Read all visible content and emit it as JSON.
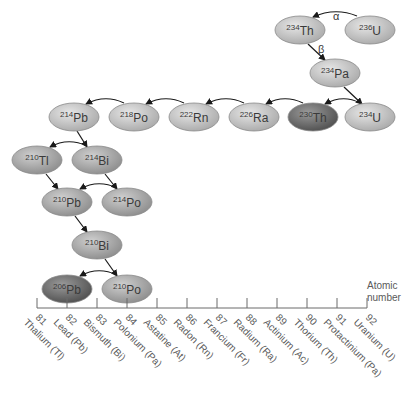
{
  "diagram": {
    "nuclides": [
      {
        "id": "th234",
        "mass": "234",
        "symbol": "Th",
        "cx": 300,
        "cy": 30,
        "shade": "light"
      },
      {
        "id": "u236",
        "mass": "236",
        "symbol": "U",
        "cx": 370,
        "cy": 30,
        "shade": "light"
      },
      {
        "id": "pa234",
        "mass": "234",
        "symbol": "Pa",
        "cx": 335,
        "cy": 73,
        "shade": "light"
      },
      {
        "id": "u234",
        "mass": "234",
        "symbol": "U",
        "cx": 370,
        "cy": 117,
        "shade": "light"
      },
      {
        "id": "th230",
        "mass": "230",
        "symbol": "Th",
        "cx": 313,
        "cy": 117,
        "shade": "dark"
      },
      {
        "id": "ra226",
        "mass": "226",
        "symbol": "Ra",
        "cx": 254,
        "cy": 117,
        "shade": "light"
      },
      {
        "id": "rn222",
        "mass": "222",
        "symbol": "Rn",
        "cx": 194,
        "cy": 117,
        "shade": "light"
      },
      {
        "id": "po218",
        "mass": "218",
        "symbol": "Po",
        "cx": 134,
        "cy": 117,
        "shade": "light"
      },
      {
        "id": "pb214",
        "mass": "214",
        "symbol": "Pb",
        "cx": 74,
        "cy": 117,
        "shade": "light"
      },
      {
        "id": "tl210",
        "mass": "210",
        "symbol": "Tl",
        "cx": 37,
        "cy": 160,
        "shade": "medium"
      },
      {
        "id": "bi214",
        "mass": "214",
        "symbol": "Bi",
        "cx": 97,
        "cy": 160,
        "shade": "medium"
      },
      {
        "id": "pb210",
        "mass": "210",
        "symbol": "Pb",
        "cx": 67,
        "cy": 202,
        "shade": "medium"
      },
      {
        "id": "po214",
        "mass": "214",
        "symbol": "Po",
        "cx": 127,
        "cy": 202,
        "shade": "medium"
      },
      {
        "id": "bi210",
        "mass": "210",
        "symbol": "Bi",
        "cx": 97,
        "cy": 245,
        "shade": "medium"
      },
      {
        "id": "pb206",
        "mass": "206",
        "symbol": "Pb",
        "cx": 67,
        "cy": 289,
        "shade": "dark"
      },
      {
        "id": "po210",
        "mass": "210",
        "symbol": "Po",
        "cx": 127,
        "cy": 289,
        "shade": "medium"
      }
    ],
    "decay_labels": {
      "alpha": "α",
      "beta": "β"
    },
    "axis": {
      "title_line1": "Atomic",
      "title_line2": "number",
      "ticks": [
        {
          "z": "81",
          "name": "Thalium (Tl)"
        },
        {
          "z": "82",
          "name": "Lead (Pb)"
        },
        {
          "z": "83",
          "name": "Bismuth (Bi)"
        },
        {
          "z": "84",
          "name": "Polonium (Pa)"
        },
        {
          "z": "85",
          "name": "Astatine (At)"
        },
        {
          "z": "86",
          "name": "Radon (Rn)"
        },
        {
          "z": "87",
          "name": "Francium (Fr)"
        },
        {
          "z": "88",
          "name": "Radium (Ra)"
        },
        {
          "z": "89",
          "name": "Actinium (Ac)"
        },
        {
          "z": "90",
          "name": "Thorium (Th)"
        },
        {
          "z": "91",
          "name": "Protactinium (Pa)"
        },
        {
          "z": "92",
          "name": "Uranium (U)"
        }
      ]
    },
    "colors": {
      "light": "#c9c9c9",
      "medium": "#acacac",
      "dark": "#6e6e6e",
      "stroke": "#8a8a8a",
      "arrow": "#1a1a1a",
      "axis": "#6a6a6a"
    }
  }
}
